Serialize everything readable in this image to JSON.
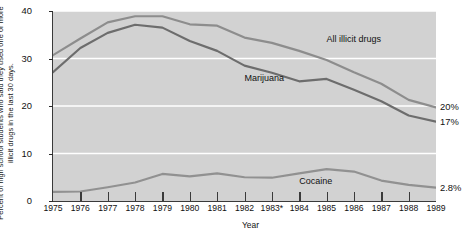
{
  "chart_data": {
    "type": "line",
    "title": "",
    "xlabel": "Year",
    "ylabel": "Percent of high school students who said they used one or more illicit drugs in the last 30 days.",
    "x": [
      1975,
      1976,
      1977,
      1978,
      1979,
      1980,
      1981,
      1982,
      1983,
      1984,
      1985,
      1986,
      1987,
      1988,
      1989
    ],
    "xticklabels": [
      "1975",
      "1976",
      "1977",
      "1978",
      "1979",
      "1980",
      "1981",
      "1982",
      "1983*",
      "1984",
      "1985",
      "1986",
      "1987",
      "1988",
      "1989"
    ],
    "yticklabels": [
      "0",
      "10",
      "20",
      "30",
      "40"
    ],
    "yticks": [
      0,
      10,
      20,
      30,
      40
    ],
    "ylim": [
      0,
      40
    ],
    "xlim": [
      1975,
      1989
    ],
    "grid": "horizontal-white",
    "legend": "inline-annotations",
    "series": [
      {
        "name": "All illicit drugs",
        "color": "#8d8d8d",
        "values": [
          30.7,
          34.2,
          37.6,
          38.9,
          38.9,
          37.2,
          36.9,
          34.4,
          33.3,
          31.6,
          29.7,
          27.1,
          24.7,
          21.3,
          19.7
        ],
        "end_label": "20%"
      },
      {
        "name": "Marijuana",
        "color": "#6d6d6d",
        "values": [
          27.1,
          32.2,
          35.4,
          37.1,
          36.5,
          33.7,
          31.6,
          28.5,
          27.0,
          25.2,
          25.7,
          23.4,
          21.0,
          18.0,
          16.7
        ],
        "end_label": "17%"
      },
      {
        "name": "Cocaine",
        "color": "#919191",
        "values": [
          1.9,
          2.0,
          2.9,
          3.9,
          5.7,
          5.2,
          5.8,
          5.0,
          4.9,
          5.8,
          6.7,
          6.2,
          4.3,
          3.4,
          2.8
        ],
        "end_label": "2.8%"
      }
    ],
    "annotations": [
      {
        "text": "All illicit drugs",
        "x": 1985.0,
        "y": 33.8
      },
      {
        "text": "Marijuana",
        "x": 1982.0,
        "y": 25.6
      },
      {
        "text": "Cocaine",
        "x": 1984.0,
        "y": 3.9
      }
    ],
    "footnote_marker": "*"
  },
  "colors": {
    "plot_background": "#d2d2d2",
    "gridline": "#ffffff",
    "axis": "#3a3a3a",
    "page_background": "#ffffff",
    "text": "#111111"
  }
}
